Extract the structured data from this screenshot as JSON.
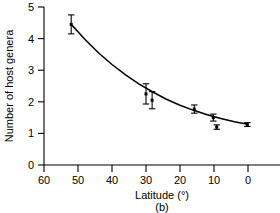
{
  "chart_data": {
    "type": "scatter",
    "title": "",
    "subtitle": "",
    "panel_label": "(b)",
    "xlabel": "Latitude (°)",
    "ylabel": "Number of host genera",
    "xlim": [
      60,
      0
    ],
    "ylim": [
      0,
      5
    ],
    "x_reversed": true,
    "grid": false,
    "legend": null,
    "xticks": [
      60,
      50,
      40,
      30,
      20,
      10,
      0
    ],
    "xticklabels": [
      "60",
      "50",
      "40",
      "30",
      "20",
      "10",
      "0"
    ],
    "yticks": [
      0,
      1,
      2,
      3,
      4,
      5
    ],
    "yticklabels": [
      "0",
      "1",
      "2",
      "3",
      "4",
      "5"
    ],
    "marker": "filled-square",
    "marker_color": "#000000",
    "line_color": "#000000",
    "errorbar_type": "symmetric-vertical",
    "points": [
      {
        "x": 52.0,
        "y": 4.45,
        "yerr": 0.3
      },
      {
        "x": 30.0,
        "y": 2.25,
        "yerr": 0.32
      },
      {
        "x": 28.2,
        "y": 2.05,
        "yerr": 0.27
      },
      {
        "x": 15.8,
        "y": 1.77,
        "yerr": 0.13
      },
      {
        "x": 10.2,
        "y": 1.5,
        "yerr": 0.11
      },
      {
        "x": 9.2,
        "y": 1.2,
        "yerr": 0.07
      },
      {
        "x": 0.2,
        "y": 1.28,
        "yerr": 0.06
      }
    ],
    "fit_curve": {
      "description": "decreasing exponential-like trend line",
      "x": [
        52.0,
        48.0,
        44.0,
        40.0,
        36.0,
        32.0,
        28.0,
        24.0,
        20.0,
        16.0,
        12.0,
        8.0,
        4.0,
        0.0
      ],
      "y": [
        4.45,
        3.98,
        3.55,
        3.18,
        2.85,
        2.56,
        2.31,
        2.08,
        1.89,
        1.73,
        1.59,
        1.47,
        1.37,
        1.29
      ]
    }
  }
}
